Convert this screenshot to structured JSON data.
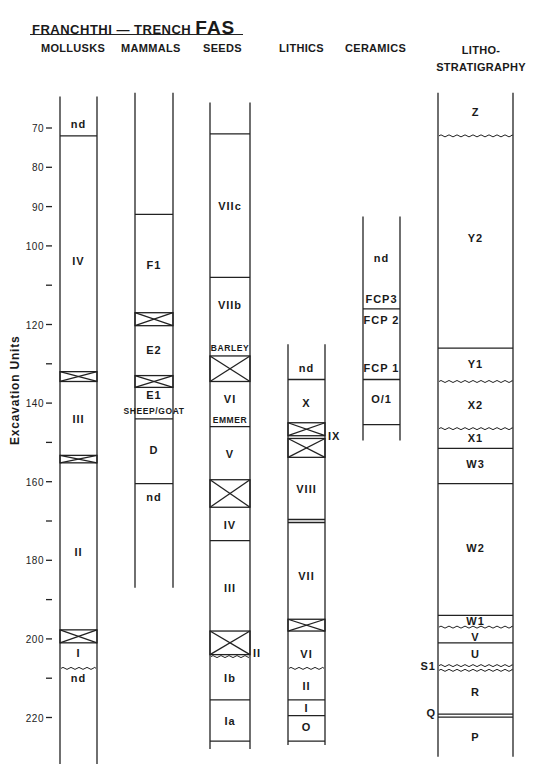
{
  "header": {
    "title_prefix": "FRANCHTHI  —  TRENCH",
    "title_main": "FAS"
  },
  "chart_data": {
    "type": "stratigraphic-column-diagram",
    "title": "FRANCHTHI — TRENCH FAS",
    "ylabel": "Excavation Units",
    "yaxis": {
      "direction": "down",
      "ticks": [
        70,
        80,
        90,
        100,
        110,
        120,
        130,
        140,
        150,
        160,
        170,
        180,
        190,
        200,
        210,
        220
      ],
      "labeled_ticks": [
        70,
        80,
        90,
        100,
        120,
        140,
        160,
        180,
        200,
        220
      ],
      "range": [
        60,
        232
      ]
    },
    "columns": [
      {
        "name": "MOLLUSKS",
        "header": [
          "MOLLUSKS"
        ],
        "range": [
          62,
          232
        ],
        "lines": [
          72
        ],
        "crosses": [
          [
            132,
            134.5
          ],
          [
            153.3,
            155.2
          ],
          [
            197.7,
            201
          ]
        ],
        "wavy": [
          207.5
        ],
        "labels": [
          {
            "text": "nd",
            "at": 69
          },
          {
            "text": "IV",
            "at": 104
          },
          {
            "text": "III",
            "at": 144
          },
          {
            "text": "II",
            "at": 178
          },
          {
            "text": "I",
            "at": 203.5
          },
          {
            "text": "nd",
            "at": 210
          }
        ]
      },
      {
        "name": "MAMMALS",
        "header": [
          "MAMMALS"
        ],
        "range": [
          61,
          187
        ],
        "lines": [
          92,
          144,
          160.5
        ],
        "crosses": [
          [
            117,
            120.3
          ],
          [
            133,
            136
          ]
        ],
        "wavy": [],
        "labels": [
          {
            "text": "F1",
            "at": 105
          },
          {
            "text": "E2",
            "at": 126.5
          },
          {
            "text": "E1",
            "at": 138
          },
          {
            "text": "SHEEP/GOAT",
            "at": 142,
            "small": true
          },
          {
            "text": "D",
            "at": 152
          },
          {
            "text": "nd",
            "at": 164
          }
        ]
      },
      {
        "name": "SEEDS",
        "header": [
          "SEEDS"
        ],
        "range": [
          63.5,
          228
        ],
        "lines": [
          71.5,
          108,
          146,
          175,
          215.5,
          226
        ],
        "crosses": [
          [
            128,
            134.5
          ],
          [
            159.5,
            166.5
          ],
          [
            198,
            204
          ]
        ],
        "wavy": [
          204.5
        ],
        "labels": [
          {
            "text": "VIIc",
            "at": 90
          },
          {
            "text": "VIIb",
            "at": 115
          },
          {
            "text": "BARLEY",
            "at": 126,
            "small": true
          },
          {
            "text": "VI",
            "at": 139
          },
          {
            "text": "EMMER",
            "at": 144.3,
            "small": true
          },
          {
            "text": "V",
            "at": 153
          },
          {
            "text": "IV",
            "at": 171
          },
          {
            "text": "III",
            "at": 187
          },
          {
            "text": "Ib",
            "at": 210
          },
          {
            "text": "Ia",
            "at": 221
          },
          {
            "text": "II",
            "at": 203.5,
            "side": "right"
          }
        ]
      },
      {
        "name": "LITHICS",
        "header": [
          "LITHICS"
        ],
        "range": [
          125,
          227
        ],
        "lines": [
          134,
          215.5,
          219.5,
          226
        ],
        "crosses": [
          [
            145,
            148.3
          ],
          [
            149,
            153.8
          ],
          [
            195,
            198
          ]
        ],
        "double_lines": [
          170
        ],
        "wavy": [
          207.5
        ],
        "labels": [
          {
            "text": "nd",
            "at": 131
          },
          {
            "text": "X",
            "at": 140
          },
          {
            "text": "IX",
            "at": 148.5,
            "side": "right"
          },
          {
            "text": "VIII",
            "at": 162
          },
          {
            "text": "VII",
            "at": 184
          },
          {
            "text": "VI",
            "at": 204
          },
          {
            "text": "II",
            "at": 212
          },
          {
            "text": "I",
            "at": 217.5
          },
          {
            "text": "O",
            "at": 222.5
          }
        ]
      },
      {
        "name": "CERAMICS",
        "header": [
          "CERAMICS"
        ],
        "range": [
          92.5,
          149.5
        ],
        "lines": [
          116,
          134,
          145.5
        ],
        "crosses": [],
        "wavy": [],
        "labels": [
          {
            "text": "nd",
            "at": 103
          },
          {
            "text": "FCP3",
            "at": 113.5
          },
          {
            "text": "FCP 2",
            "at": 119
          },
          {
            "text": "FCP 1",
            "at": 131
          },
          {
            "text": "O/1",
            "at": 139
          }
        ]
      },
      {
        "name": "LITHO-STRATIGRAPHY",
        "header": [
          "LITHO-",
          "STRATIGRAPHY"
        ],
        "range": [
          61,
          230
        ],
        "lines": [
          126,
          151.5,
          160.5,
          194,
          201
        ],
        "crosses": [],
        "double_lines": [
          219.5
        ],
        "wavy": [
          72,
          134.5,
          146.5,
          197,
          206.8,
          208
        ],
        "labels": [
          {
            "text": "Z",
            "at": 66
          },
          {
            "text": "Y2",
            "at": 98
          },
          {
            "text": "Y1",
            "at": 130
          },
          {
            "text": "X2",
            "at": 140.5
          },
          {
            "text": "X1",
            "at": 149
          },
          {
            "text": "W3",
            "at": 155.5
          },
          {
            "text": "W2",
            "at": 177
          },
          {
            "text": "W1",
            "at": 195.5
          },
          {
            "text": "V",
            "at": 199.5
          },
          {
            "text": "U",
            "at": 204
          },
          {
            "text": "S1",
            "at": 207,
            "side": "left"
          },
          {
            "text": "R",
            "at": 213.5
          },
          {
            "text": "Q",
            "at": 219,
            "side": "left"
          },
          {
            "text": "P",
            "at": 225
          }
        ]
      }
    ]
  }
}
